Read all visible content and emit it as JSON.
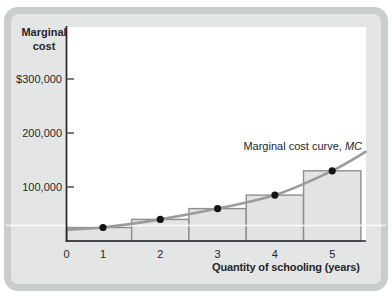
{
  "figure": {
    "y_axis_title": "Marginal\ncost",
    "x_axis_title": "Quantity of schooling (years)",
    "curve_label": {
      "prefix": "Marginal cost curve, ",
      "mc": "MC"
    },
    "y_tick_labels": [
      "$300,000",
      "200,000",
      "100,000"
    ],
    "x_tick_labels": [
      "0",
      "1",
      "2",
      "3",
      "4",
      "5"
    ]
  },
  "chart_data": {
    "type": "bar",
    "title": "",
    "xlabel": "Quantity of schooling (years)",
    "ylabel": "Marginal cost",
    "categories": [
      1,
      2,
      3,
      4,
      5
    ],
    "values": [
      25000,
      40000,
      60000,
      85000,
      130000
    ],
    "bar_spans": [
      [
        0.37,
        1.5
      ],
      [
        1.5,
        2.5
      ],
      [
        2.5,
        3.5
      ],
      [
        3.5,
        4.5
      ],
      [
        4.5,
        5.5
      ]
    ],
    "ylim": [
      0,
      400000
    ],
    "y_ticks": [
      100000,
      200000,
      300000
    ],
    "x_ticks": [
      0,
      1,
      2,
      3,
      4,
      5
    ],
    "grid": false,
    "legend": "none",
    "markers_on_bar_tops": true,
    "curve": {
      "name": "Marginal cost curve, MC",
      "points": [
        {
          "x": 0.37,
          "y": 21000
        },
        {
          "x": 1,
          "y": 25000
        },
        {
          "x": 2,
          "y": 40000
        },
        {
          "x": 3,
          "y": 60000
        },
        {
          "x": 4,
          "y": 85000
        },
        {
          "x": 5,
          "y": 130000
        },
        {
          "x": 5.58,
          "y": 165000
        }
      ]
    }
  },
  "colors": {
    "card_bg": "#e3e6e4",
    "card_border": "#c9cecd",
    "plot_bg": "#ffffff",
    "bar_fill": "#e3e3e3",
    "bar_border": "#8d8d8d",
    "curve": "#9b9b9b",
    "dot": "#141414",
    "axis": "#26262c",
    "text": "#26262c",
    "stripe_artifact": "#ffffff"
  }
}
